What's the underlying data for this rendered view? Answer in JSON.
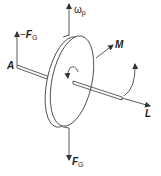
{
  "diagram": {
    "type": "gyroscope-precession",
    "stroke_color": "#333333",
    "labels": {
      "omega_p": {
        "symbol": "ω",
        "subscript": "p"
      },
      "neg_fg": {
        "prefix": "−",
        "symbol": "F",
        "subscript": "G"
      },
      "fg": {
        "symbol": "F",
        "subscript": "G"
      },
      "a": "A",
      "m": "M",
      "l": "L"
    }
  }
}
